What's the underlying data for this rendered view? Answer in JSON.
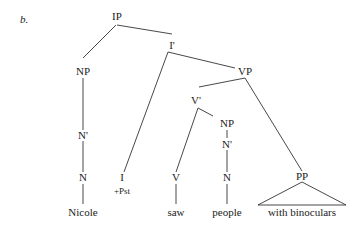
{
  "example_label": "b.",
  "nodes": {
    "ip": "IP",
    "i_bar": "I'",
    "np_subj": "NP",
    "n_bar_subj": "N'",
    "n_subj": "N",
    "word_nicole": "Nicole",
    "i": "I",
    "i_feature": "+Pst",
    "vp": "VP",
    "v_bar": "V'",
    "v": "V",
    "word_saw": "saw",
    "np_obj": "NP",
    "n_bar_obj": "N'",
    "n_obj": "N",
    "word_people": "people",
    "pp": "PP",
    "phrase_with_binoculars": "with binoculars"
  }
}
